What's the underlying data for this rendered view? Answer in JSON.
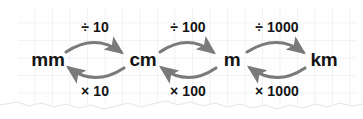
{
  "diagram": {
    "background": {
      "style": "grid-paper",
      "grid_color": "#b0bac4",
      "paper_color": "#fdfdfd",
      "torn_bottom_edge": true
    },
    "arrow_color": "#7a7a7a",
    "text_color": "#141414",
    "units": [
      {
        "id": "mm",
        "label": "mm",
        "x": 48,
        "y": 60
      },
      {
        "id": "cm",
        "label": "cm",
        "x": 143,
        "y": 60
      },
      {
        "id": "m",
        "label": "m",
        "x": 232,
        "y": 60
      },
      {
        "id": "km",
        "label": "km",
        "x": 324,
        "y": 60
      }
    ],
    "conversions": [
      {
        "from": "mm",
        "to": "cm",
        "divide_label": "÷ 10",
        "multiply_label": "× 10",
        "divide_label_x": 95,
        "divide_label_y": 27,
        "multiply_label_x": 95,
        "multiply_label_y": 91
      },
      {
        "from": "cm",
        "to": "m",
        "divide_label": "÷ 100",
        "multiply_label": "× 100",
        "divide_label_x": 187,
        "divide_label_y": 27,
        "multiply_label_x": 187,
        "multiply_label_y": 91
      },
      {
        "from": "m",
        "to": "km",
        "divide_label": "÷ 1000",
        "multiply_label": "× 1000",
        "divide_label_x": 277,
        "divide_label_y": 27,
        "multiply_label_x": 277,
        "multiply_label_y": 91
      }
    ]
  }
}
